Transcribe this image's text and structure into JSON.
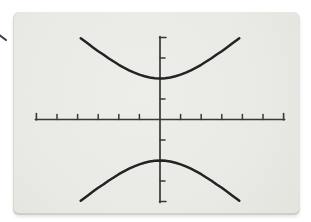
{
  "page": {
    "background": "#ffffff"
  },
  "screen": {
    "background": "#e9e9e6",
    "edge": "#d5d5d0"
  },
  "chart_data": {
    "type": "line",
    "title": "",
    "xlabel": "",
    "ylabel": "",
    "grid": false,
    "legend": false,
    "axes_color": "#383838",
    "curve_color": "#232323",
    "window": {
      "xmin": -6,
      "xmax": 6,
      "xscl": 1,
      "ymin": -4,
      "ymax": 4,
      "yscl": 1
    },
    "x_ticks": [
      -5,
      -4,
      -3,
      -2,
      -1,
      1,
      2,
      3,
      4,
      5
    ],
    "y_ticks": [
      -3,
      -2,
      -1,
      1,
      2,
      3
    ],
    "series": [
      {
        "name": "upper-branch",
        "points": [
          [
            -3.85,
            3.96
          ],
          [
            -3.75,
            3.89
          ],
          [
            -3.5,
            3.7
          ],
          [
            -3.25,
            3.51
          ],
          [
            -3,
            3.33
          ],
          [
            -2.75,
            3.17
          ],
          [
            -2.5,
            2.99
          ],
          [
            -2.25,
            2.83
          ],
          [
            -2,
            2.67
          ],
          [
            -1.75,
            2.53
          ],
          [
            -1.5,
            2.4
          ],
          [
            -1.25,
            2.29
          ],
          [
            -1,
            2.19
          ],
          [
            -0.75,
            2.11
          ],
          [
            -0.5,
            2.05
          ],
          [
            -0.25,
            2.01
          ],
          [
            0,
            2
          ],
          [
            0.25,
            2.01
          ],
          [
            0.5,
            2.05
          ],
          [
            0.75,
            2.11
          ],
          [
            1,
            2.19
          ],
          [
            1.25,
            2.29
          ],
          [
            1.5,
            2.4
          ],
          [
            1.75,
            2.53
          ],
          [
            2,
            2.67
          ],
          [
            2.25,
            2.83
          ],
          [
            2.5,
            2.99
          ],
          [
            2.75,
            3.17
          ],
          [
            3,
            3.33
          ],
          [
            3.25,
            3.51
          ],
          [
            3.5,
            3.7
          ],
          [
            3.75,
            3.89
          ],
          [
            3.85,
            3.96
          ]
        ]
      },
      {
        "name": "lower-branch",
        "points": [
          [
            -3.85,
            -3.96
          ],
          [
            -3.75,
            -3.89
          ],
          [
            -3.5,
            -3.7
          ],
          [
            -3.25,
            -3.51
          ],
          [
            -3,
            -3.33
          ],
          [
            -2.75,
            -3.17
          ],
          [
            -2.5,
            -2.99
          ],
          [
            -2.25,
            -2.83
          ],
          [
            -2,
            -2.67
          ],
          [
            -1.75,
            -2.53
          ],
          [
            -1.5,
            -2.4
          ],
          [
            -1.25,
            -2.29
          ],
          [
            -1,
            -2.19
          ],
          [
            -0.75,
            -2.11
          ],
          [
            -0.5,
            -2.05
          ],
          [
            -0.25,
            -2.01
          ],
          [
            0,
            -2
          ],
          [
            0.25,
            -2.01
          ],
          [
            0.5,
            -2.05
          ],
          [
            0.75,
            -2.11
          ],
          [
            1,
            -2.19
          ],
          [
            1.25,
            -2.29
          ],
          [
            1.5,
            -2.4
          ],
          [
            1.75,
            -2.53
          ],
          [
            2,
            -2.67
          ],
          [
            2.25,
            -2.83
          ],
          [
            2.5,
            -2.99
          ],
          [
            2.75,
            -3.17
          ],
          [
            3,
            -3.33
          ],
          [
            3.25,
            -3.51
          ],
          [
            3.5,
            -3.7
          ],
          [
            3.75,
            -3.89
          ],
          [
            3.85,
            -3.96
          ]
        ]
      }
    ]
  }
}
